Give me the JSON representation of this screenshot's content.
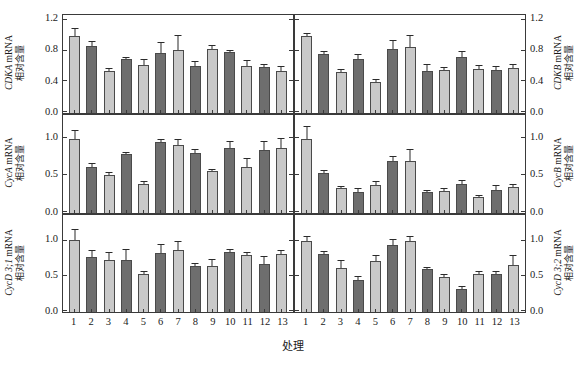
{
  "figure": {
    "xaxis_title": "处理",
    "relative_content_cn": "相对含量",
    "mrna_suffix": "mRNA"
  },
  "chart_data": [
    {
      "id": "cdka",
      "type": "bar",
      "position": "top-left",
      "title": "CDKA mRNA 相对含量",
      "gene": "CDKA",
      "ylabel_line1": "CDKA mRNA",
      "ylabel_line2": "相对含量",
      "xlabel": "处理",
      "ylim": [
        0.0,
        1.2
      ],
      "yticks": [
        0.0,
        0.4,
        0.8,
        1.2
      ],
      "ytick_labels": [
        "0.0",
        "0.4",
        "0.8",
        "1.2"
      ],
      "grid": false,
      "legend": "none",
      "categories": [
        "1",
        "2",
        "3",
        "4",
        "5",
        "6",
        "7",
        "8",
        "9",
        "10",
        "11",
        "12",
        "13"
      ],
      "values": [
        1.01,
        0.87,
        0.55,
        0.7,
        0.63,
        0.78,
        0.82,
        0.61,
        0.84,
        0.8,
        0.61,
        0.6,
        0.55
      ],
      "errors": [
        0.09,
        0.05,
        0.02,
        0.02,
        0.06,
        0.13,
        0.18,
        0.05,
        0.03,
        0.01,
        0.07,
        0.02,
        0.05
      ],
      "fills": [
        "light",
        "dark",
        "light",
        "dark",
        "light",
        "dark",
        "light",
        "dark",
        "light",
        "dark",
        "light",
        "dark",
        "light"
      ]
    },
    {
      "id": "cdkb",
      "type": "bar",
      "position": "top-right",
      "title": "CDKB mRNA 相对含量",
      "gene": "CDKB",
      "ylabel_line1": "CDKB mRNA",
      "ylabel_line2": "相对含量",
      "xlabel": "处理",
      "ylim": [
        0.0,
        1.2
      ],
      "yticks": [
        0.0,
        0.4,
        0.8,
        1.2
      ],
      "ytick_labels": [
        "0.0",
        "0.4",
        "0.8",
        "1.2"
      ],
      "grid": false,
      "legend": "none",
      "categories": [
        "1",
        "2",
        "3",
        "4",
        "5",
        "6",
        "7",
        "8",
        "9",
        "10",
        "11",
        "12",
        "13"
      ],
      "values": [
        1.0,
        0.77,
        0.53,
        0.7,
        0.4,
        0.84,
        0.86,
        0.55,
        0.56,
        0.73,
        0.58,
        0.56,
        0.59
      ],
      "errors": [
        0.03,
        0.02,
        0.03,
        0.06,
        0.03,
        0.1,
        0.14,
        0.07,
        0.03,
        0.07,
        0.03,
        0.04,
        0.04
      ],
      "fills": [
        "light",
        "dark",
        "light",
        "dark",
        "light",
        "dark",
        "light",
        "dark",
        "light",
        "dark",
        "light",
        "dark",
        "light"
      ]
    },
    {
      "id": "cyca",
      "type": "bar",
      "position": "middle-left",
      "title": "CycA mRNA 相对含量",
      "gene": "CycA",
      "ylabel_line1": "CycA mRNA",
      "ylabel_line2": "相对含量",
      "xlabel": "处理",
      "ylim": [
        0.0,
        1.25
      ],
      "yticks": [
        0.0,
        0.5,
        1.0
      ],
      "ytick_labels": [
        "0.0",
        "0.5",
        "1.0"
      ],
      "grid": false,
      "legend": "none",
      "categories": [
        "1",
        "2",
        "3",
        "4",
        "5",
        "6",
        "7",
        "8",
        "9",
        "10",
        "11",
        "12",
        "13"
      ],
      "values": [
        1.01,
        0.62,
        0.51,
        0.8,
        0.4,
        0.96,
        0.93,
        0.81,
        0.57,
        0.88,
        0.63,
        0.85,
        0.89
      ],
      "errors": [
        0.11,
        0.04,
        0.04,
        0.02,
        0.02,
        0.03,
        0.06,
        0.05,
        0.02,
        0.09,
        0.1,
        0.12,
        0.12
      ],
      "fills": [
        "light",
        "dark",
        "light",
        "dark",
        "light",
        "dark",
        "light",
        "dark",
        "light",
        "dark",
        "light",
        "dark",
        "light"
      ]
    },
    {
      "id": "cycb",
      "type": "bar",
      "position": "middle-right",
      "title": "CycB mRNA 相对含量",
      "gene": "CycB",
      "ylabel_line1": "CycB mRNA",
      "ylabel_line2": "相对含量",
      "xlabel": "处理",
      "ylim": [
        0.0,
        1.25
      ],
      "yticks": [
        0.0,
        0.5,
        1.0
      ],
      "ytick_labels": [
        "0.0",
        "0.5",
        "1.0"
      ],
      "grid": false,
      "legend": "none",
      "categories": [
        "1",
        "2",
        "3",
        "4",
        "5",
        "6",
        "7",
        "8",
        "9",
        "10",
        "11",
        "12",
        "13"
      ],
      "values": [
        1.0,
        0.55,
        0.34,
        0.29,
        0.38,
        0.71,
        0.7,
        0.28,
        0.3,
        0.4,
        0.22,
        0.31,
        0.36
      ],
      "errors": [
        0.17,
        0.02,
        0.02,
        0.03,
        0.04,
        0.05,
        0.15,
        0.02,
        0.03,
        0.03,
        0.01,
        0.06,
        0.02
      ],
      "fills": [
        "light",
        "dark",
        "light",
        "dark",
        "light",
        "dark",
        "light",
        "dark",
        "light",
        "dark",
        "light",
        "dark",
        "light"
      ]
    },
    {
      "id": "cycd31",
      "type": "bar",
      "position": "bottom-left",
      "title": "CycD 3;1 mRNA 相对含量",
      "gene": "CycD 3;1",
      "ylabel_line1": "CycD 3;1 mRNA",
      "ylabel_line2": "相对含量",
      "xlabel": "处理",
      "ylim": [
        0.0,
        1.3
      ],
      "yticks": [
        0.0,
        0.5,
        1.0
      ],
      "ytick_labels": [
        "0.0",
        "0.5",
        "1.0"
      ],
      "grid": false,
      "legend": "none",
      "categories": [
        "1",
        "2",
        "3",
        "4",
        "5",
        "6",
        "7",
        "8",
        "9",
        "10",
        "11",
        "12",
        "13"
      ],
      "values": [
        1.03,
        0.78,
        0.74,
        0.75,
        0.55,
        0.84,
        0.89,
        0.66,
        0.66,
        0.86,
        0.82,
        0.69,
        0.83
      ],
      "errors": [
        0.14,
        0.09,
        0.11,
        0.14,
        0.02,
        0.12,
        0.11,
        0.02,
        0.08,
        0.02,
        0.02,
        0.09,
        0.04
      ],
      "fills": [
        "light",
        "dark",
        "light",
        "dark",
        "light",
        "dark",
        "light",
        "dark",
        "light",
        "dark",
        "light",
        "dark",
        "light"
      ]
    },
    {
      "id": "cycd32",
      "type": "bar",
      "position": "bottom-right",
      "title": "CycD 3;2 mRNA 相对含量",
      "gene": "CycD 3;2",
      "ylabel_line1": "CycD 3;2 mRNA",
      "ylabel_line2": "相对含量",
      "xlabel": "处理",
      "ylim": [
        0.0,
        1.3
      ],
      "yticks": [
        0.0,
        0.5,
        1.0
      ],
      "ytick_labels": [
        "0.0",
        "0.5",
        "1.0"
      ],
      "grid": false,
      "legend": "none",
      "categories": [
        "1",
        "2",
        "3",
        "4",
        "5",
        "6",
        "7",
        "8",
        "9",
        "10",
        "11",
        "12",
        "13"
      ],
      "values": [
        1.02,
        0.83,
        0.63,
        0.46,
        0.73,
        0.96,
        1.02,
        0.61,
        0.5,
        0.33,
        0.54,
        0.54,
        0.67
      ],
      "errors": [
        0.05,
        0.03,
        0.1,
        0.04,
        0.07,
        0.07,
        0.05,
        0.02,
        0.03,
        0.03,
        0.03,
        0.03,
        0.13
      ],
      "fills": [
        "light",
        "dark",
        "light",
        "dark",
        "light",
        "dark",
        "light",
        "dark",
        "light",
        "dark",
        "light",
        "dark",
        "light"
      ]
    }
  ],
  "style": {
    "bar_light": "#c9c9c9",
    "bar_dark": "#6e6e6e",
    "axis_color": "#3a3a3a",
    "text_color": "#1a1a1a"
  }
}
